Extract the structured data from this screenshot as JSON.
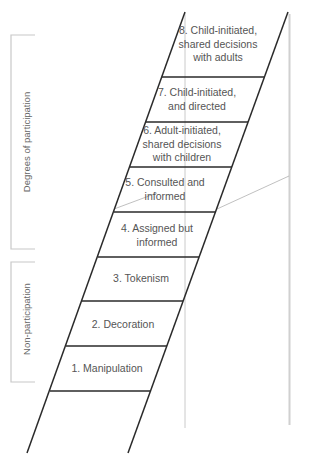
{
  "diagram": {
    "type": "ladder-of-participation",
    "colors": {
      "ladder": "#2a2a2a",
      "guide": "#bbbbbb",
      "bracket": "#c8c8c8",
      "text": "#555555"
    },
    "groups": [
      {
        "label": "Degrees of participation",
        "rungs": [
          4,
          5,
          6,
          7,
          8
        ]
      },
      {
        "label": "Non-participation",
        "rungs": [
          1,
          2,
          3
        ]
      }
    ],
    "rungs": [
      {
        "number": 8,
        "label": "8. Child-initiated,\nshared decisions\nwith adults"
      },
      {
        "number": 7,
        "label": "7. Child-initiated,\nand directed"
      },
      {
        "number": 6,
        "label": "6. Adult-initiated,\nshared decisions\nwith children"
      },
      {
        "number": 5,
        "label": "5. Consulted and\ninformed"
      },
      {
        "number": 4,
        "label": "4. Assigned but\ninformed"
      },
      {
        "number": 3,
        "label": "3. Tokenism"
      },
      {
        "number": 2,
        "label": "2. Decoration"
      },
      {
        "number": 1,
        "label": "1. Manipulation"
      }
    ]
  }
}
